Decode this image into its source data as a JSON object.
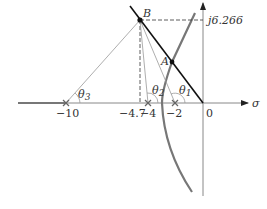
{
  "diagram": {
    "axes": {
      "x_label": "σ",
      "y_marker_label": "j6.266"
    },
    "points": {
      "B": "B",
      "A": "A"
    },
    "poles": [
      {
        "label": "−10",
        "value": -10
      },
      {
        "label": "−4",
        "value": -4
      },
      {
        "label": "−2",
        "value": -2
      }
    ],
    "markers": {
      "b_projection": "−4.7",
      "origin": "0"
    },
    "angles": {
      "theta1": "θ",
      "theta1_sub": "1",
      "theta2": "θ",
      "theta2_sub": "2",
      "theta3": "θ",
      "theta3_sub": "3"
    },
    "colors": {
      "axis": "#888888",
      "locus": "#777777",
      "line": "#111111",
      "dashed": "#333333",
      "thin": "#999999"
    }
  }
}
